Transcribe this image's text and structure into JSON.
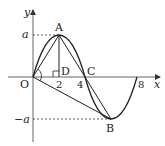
{
  "figure": {
    "type": "function-graph",
    "axes": {
      "x_label": "x",
      "y_label": "y",
      "origin_label": "O"
    },
    "x_ticks": [
      "2",
      "4",
      "8"
    ],
    "y_ticks": [
      "a",
      "−a"
    ],
    "points": {
      "A": {
        "label": "A",
        "x": 2,
        "y": "a"
      },
      "B": {
        "label": "B",
        "x": 6,
        "y": "-a"
      },
      "C": {
        "label": "C",
        "x": 4,
        "y": 0
      },
      "D": {
        "label": "D",
        "x": 2,
        "y": 0
      },
      "O": {
        "label": "O",
        "x": 0,
        "y": 0
      }
    },
    "curve": "sinusoid through O(0,0), A(2,a), C(4,0), B(6,-a), (8,0)",
    "segments": [
      "OA",
      "AD",
      "AB",
      "OB"
    ],
    "dashed": [
      "a to A",
      "-a to B"
    ],
    "right_angle_at": "D",
    "angle_mark_at": "O"
  }
}
